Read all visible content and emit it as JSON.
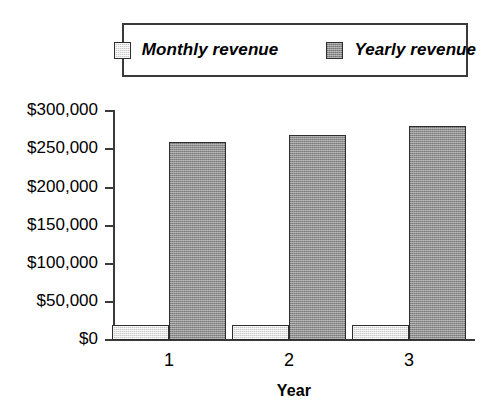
{
  "chart_data": {
    "type": "bar",
    "title": "",
    "xlabel": "Year",
    "ylabel": "",
    "categories": [
      "1",
      "2",
      "3"
    ],
    "series": [
      {
        "name": "Monthly revenue",
        "values": [
          20000,
          20000,
          20000
        ],
        "color": "#c8c8c8"
      },
      {
        "name": "Yearly revenue",
        "values": [
          258000,
          268000,
          279000
        ],
        "color": "#909090"
      }
    ],
    "ylim": [
      0,
      300000
    ],
    "ytick_values": [
      300000,
      250000,
      200000,
      150000,
      100000,
      50000,
      0
    ],
    "ytick_labels": [
      "$300,000",
      "$250,000",
      "$200,000",
      "$150,000",
      "$100,000",
      "$50,000",
      "$0"
    ],
    "grid": false,
    "legend_position": "top",
    "legend": [
      {
        "label": "Monthly revenue",
        "swatch": "light-gray-square"
      },
      {
        "label": "Yearly revenue",
        "swatch": "dark-gray-square"
      }
    ]
  },
  "colors": {
    "axis": "#3a3a3a",
    "bar_border": "#2e2e2e",
    "legend_border": "#3a3a3a",
    "background": "#ffffff",
    "series_light": "#c8c8c8",
    "series_dark": "#909090"
  }
}
